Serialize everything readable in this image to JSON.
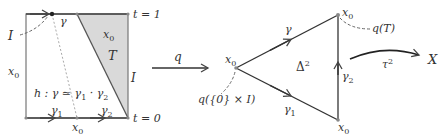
{
  "colors": {
    "stroke": "#555555",
    "fill_T": "#d9d9d9",
    "dashed": "#999999",
    "text": "#333333"
  },
  "square": {
    "labels": {
      "t1": "t = 1",
      "t0": "t = 0",
      "I_left": "I",
      "I_right": "I",
      "x0_left": "x",
      "x0_left_sub": "0",
      "x0_region": "x",
      "x0_region_sub": "0",
      "x0_bottom": "x",
      "x0_bottom_sub": "0",
      "T": "T",
      "gamma_top": "γ",
      "gamma1": "γ",
      "gamma1_sub": "1",
      "gamma2": "γ",
      "gamma2_sub": "2",
      "homotopy": "h : γ ≃ γ",
      "homotopy_sub1": "1",
      "homotopy_mid": " · γ",
      "homotopy_sub2": "2"
    }
  },
  "map_q": {
    "label": "q"
  },
  "simplex": {
    "labels": {
      "x0_left": "x",
      "x0_left_sub": "0",
      "x0_top": "x",
      "x0_top_sub": "0",
      "x0_bottom": "x",
      "x0_bottom_sub": "0",
      "gamma": "γ",
      "gamma1": "γ",
      "gamma1_sub": "1",
      "gamma2": "γ",
      "gamma2_sub": "2",
      "delta": "Δ",
      "delta_sup": "2",
      "qT": "q(T)",
      "q0I": "q({0} × I)"
    }
  },
  "map_tau": {
    "label": "τ",
    "label_sup": "2",
    "target": "X"
  }
}
